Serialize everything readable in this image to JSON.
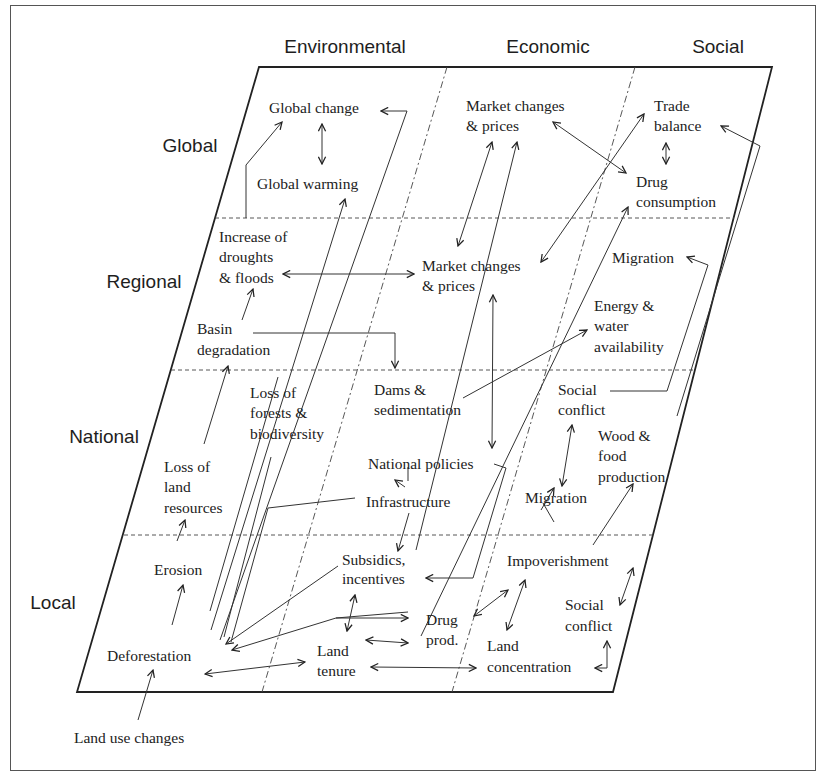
{
  "columns": [
    "Environmental",
    "Economic",
    "Social"
  ],
  "rows": [
    "Global",
    "Regional",
    "National",
    "Local"
  ],
  "nodes": {
    "global_change": "Global change",
    "global_warming": "Global warming",
    "market_global_1": "Market changes",
    "market_global_2": "& prices",
    "trade_1": "Trade",
    "trade_2": "balance",
    "drug_cons_1": "Drug",
    "drug_cons_2": "consumption",
    "droughts_1": "Increase of",
    "droughts_2": "droughts",
    "droughts_3": "& floods",
    "market_reg_1": "Market changes",
    "market_reg_2": "& prices",
    "migration_reg": "Migration",
    "energy_1": "Energy &",
    "energy_2": "water",
    "energy_3": "availability",
    "basin_1": "Basin",
    "basin_2": "degradation",
    "forests_1": "Loss of",
    "forests_2": "forests &",
    "forests_3": "biodiversity",
    "dams_1": "Dams &",
    "dams_2": "sedimentation",
    "social_conflict_nat_1": "Social",
    "social_conflict_nat_2": "conflict",
    "land_res_1": "Loss of",
    "land_res_2": "land",
    "land_res_3": "resources",
    "national_policies": "National policies",
    "infrastructure": "Infrastructure",
    "wood_1": "Wood &",
    "wood_2": "food",
    "wood_3": "production",
    "migration_nat": "Migration",
    "erosion": "Erosion",
    "subsidies_1": "Subsidics,",
    "subsidies_2": "incentives",
    "impoverishment": "Impoverishment",
    "social_conflict_loc_1": "Social",
    "social_conflict_loc_2": "conflict",
    "drug_prod_1": "Drug",
    "drug_prod_2": "prod.",
    "deforestation": "Deforestation",
    "land_tenure_1": "Land",
    "land_tenure_2": "tenure",
    "land_conc_1": "Land",
    "land_conc_2": "concentration",
    "land_use": "Land use changes"
  }
}
